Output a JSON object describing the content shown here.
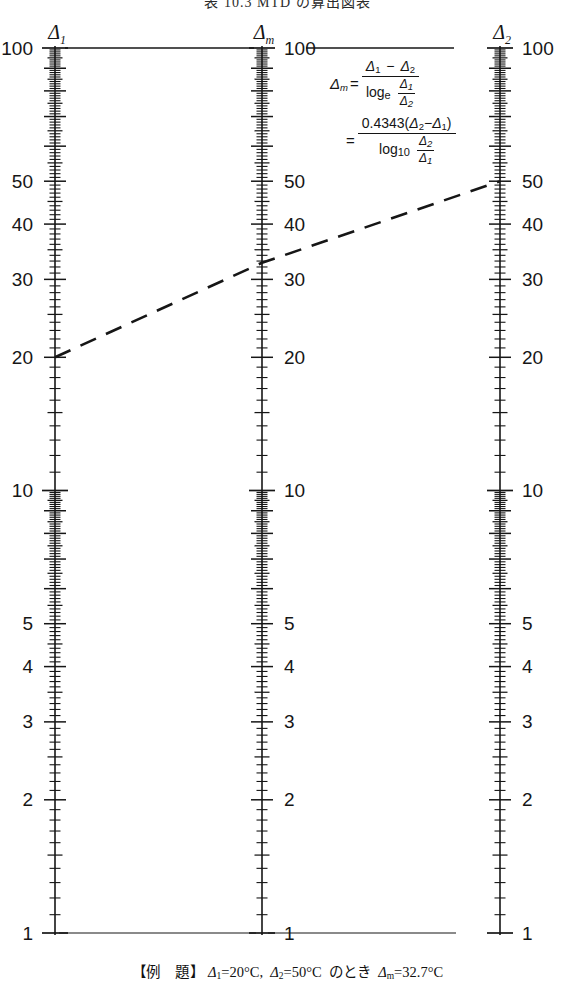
{
  "title": "表 10.3  MTD の算出図表",
  "caption": {
    "label": "【例　題】",
    "text": "Δ1=20°C,  Δ2=50°C  のとき  Δm=32.7°C"
  },
  "formula": {
    "line1": {
      "lhs": "Δm",
      "eq": "=",
      "numerator": "Δ1 − Δ2",
      "denominator": "loge  Δ1/Δ2"
    },
    "line2": {
      "eq": "=",
      "numerator": "0.4343(Δ2−Δ1)",
      "denominator": "log10  Δ2/Δ1"
    },
    "parts": {
      "delta": "Δ",
      "sub_m": "m",
      "sub_1": "1",
      "sub_2": "2",
      "minus": "−",
      "log": "log",
      "sub_e": "e",
      "sub_10": "10",
      "coefficient": "0.4343",
      "paren_open": "(",
      "paren_close": ")"
    }
  },
  "axes": [
    {
      "id": "delta1",
      "header": "Δ1",
      "header_delta": "Δ",
      "header_sub": "1",
      "x": 55,
      "label_side": "left",
      "scale": "log",
      "min": 1,
      "max": 100,
      "labels": [
        {
          "value": 100,
          "text": "100"
        },
        {
          "value": 50,
          "text": "50"
        },
        {
          "value": 40,
          "text": "40"
        },
        {
          "value": 30,
          "text": "30"
        },
        {
          "value": 20,
          "text": "20"
        },
        {
          "value": 10,
          "text": "10"
        },
        {
          "value": 5,
          "text": "5"
        },
        {
          "value": 4,
          "text": "4"
        },
        {
          "value": 3,
          "text": "3"
        },
        {
          "value": 2,
          "text": "2"
        },
        {
          "value": 1,
          "text": "1"
        }
      ]
    },
    {
      "id": "deltam",
      "header": "Δm",
      "header_delta": "Δ",
      "header_sub": "m",
      "x": 262,
      "label_side": "right",
      "scale": "log",
      "min": 1,
      "max": 100,
      "labels": [
        {
          "value": 100,
          "text": "100"
        },
        {
          "value": 50,
          "text": "50"
        },
        {
          "value": 40,
          "text": "40"
        },
        {
          "value": 30,
          "text": "30"
        },
        {
          "value": 20,
          "text": "20"
        },
        {
          "value": 10,
          "text": "10"
        },
        {
          "value": 5,
          "text": "5"
        },
        {
          "value": 4,
          "text": "4"
        },
        {
          "value": 3,
          "text": "3"
        },
        {
          "value": 2,
          "text": "2"
        },
        {
          "value": 1,
          "text": "1"
        }
      ]
    },
    {
      "id": "delta2",
      "header": "Δ2",
      "header_delta": "Δ",
      "header_sub": "2",
      "x": 500,
      "label_side": "right",
      "scale": "log",
      "min": 1,
      "max": 100,
      "labels": [
        {
          "value": 100,
          "text": "100"
        },
        {
          "value": 50,
          "text": "50"
        },
        {
          "value": 40,
          "text": "40"
        },
        {
          "value": 30,
          "text": "30"
        },
        {
          "value": 20,
          "text": "20"
        },
        {
          "value": 10,
          "text": "10"
        },
        {
          "value": 5,
          "text": "5"
        },
        {
          "value": 4,
          "text": "4"
        },
        {
          "value": 3,
          "text": "3"
        },
        {
          "value": 2,
          "text": "2"
        },
        {
          "value": 1,
          "text": "1"
        }
      ]
    }
  ],
  "example_line": {
    "style": "dashed",
    "points": [
      {
        "axis": "delta1",
        "value": 20
      },
      {
        "axis": "deltam",
        "value": 32.7
      },
      {
        "axis": "delta2",
        "value": 50
      }
    ]
  },
  "chart_data": {
    "type": "line",
    "title": "表 10.3  MTD の算出図表",
    "subtype": "nomogram",
    "xlabel": "",
    "ylabel": "",
    "axis_scale": "log",
    "axis_range": [
      1,
      100
    ],
    "grid": false,
    "legend": "none",
    "series": [
      {
        "name": "example alignment line",
        "x": [
          55,
          262,
          500
        ],
        "values": [
          20,
          32.7,
          50
        ],
        "axis_names": [
          "Δ1",
          "Δm",
          "Δ2"
        ]
      }
    ],
    "annotations": [
      "Δm = (Δ1 − Δ2) / (loge Δ1/Δ2)",
      "= 0.4343(Δ2−Δ1) / (log10 Δ2/Δ1)",
      "【例　題】 Δ1=20°C, Δ2=50°C のとき Δm=32.7°C"
    ]
  },
  "geometry": {
    "top_y": 48,
    "bottom_y": 933,
    "canvas_width": 575,
    "canvas_height": 996
  },
  "colors": {
    "ink": "#161616",
    "line": "#202020",
    "background": "#ffffff"
  }
}
